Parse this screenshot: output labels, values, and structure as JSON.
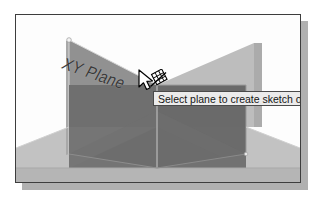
{
  "viewport": {
    "name": "cad-3d-viewport",
    "background_color": "#fdfdfd",
    "border_color": "#3d3d3d",
    "shadow_color": "#b0b0b0"
  },
  "scene": {
    "plane_label": "XY Plane",
    "highlighted_plane_color": "#8e8e8e",
    "light_plane_color": "#b8b8b8",
    "dark_solid_color": "#6e6e6e",
    "mid_solid_color": "#7d7d7d",
    "edge_color": "#cfcfcf",
    "vertex_marker_color": "#f2f2f2"
  },
  "tooltip": {
    "text": "Select plane to create sketch or",
    "background_color": "#ebebeb",
    "border_color": "#4a4a4a",
    "text_color": "#151515"
  },
  "cursor": {
    "type": "arrow-with-sketch-badge",
    "arrow_fill": "#ffffff",
    "arrow_stroke": "#000000"
  }
}
